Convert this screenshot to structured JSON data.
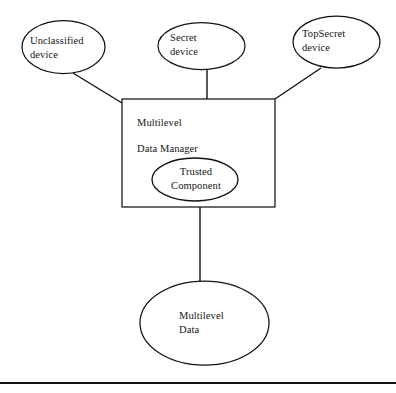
{
  "diagram": {
    "background_color": "#ffffff",
    "stroke_color": "#121212",
    "nodes": {
      "unclassified_device": {
        "label": "Unclassified\ndevice",
        "shape": "ellipse"
      },
      "secret_device": {
        "label": "Secret\ndevice",
        "shape": "ellipse"
      },
      "topsecret_device": {
        "label": "TopSecret\ndevice",
        "shape": "ellipse"
      },
      "multilevel_data_manager": {
        "line1": "Multilevel",
        "line2": "Data Manager",
        "shape": "rectangle"
      },
      "trusted_component": {
        "label": "Trusted\nComponent",
        "shape": "ellipse"
      },
      "multilevel_data": {
        "label": "Multilevel\nData",
        "shape": "ellipse"
      }
    },
    "edges": [
      {
        "from": "unclassified_device",
        "to": "multilevel_data_manager",
        "style": "diagonal"
      },
      {
        "from": "secret_device",
        "to": "multilevel_data_manager",
        "style": "vertical"
      },
      {
        "from": "topsecret_device",
        "to": "multilevel_data_manager",
        "style": "diagonal"
      },
      {
        "from": "multilevel_data_manager",
        "to": "multilevel_data",
        "style": "vertical"
      }
    ],
    "footer_rule": {
      "present": true
    }
  }
}
